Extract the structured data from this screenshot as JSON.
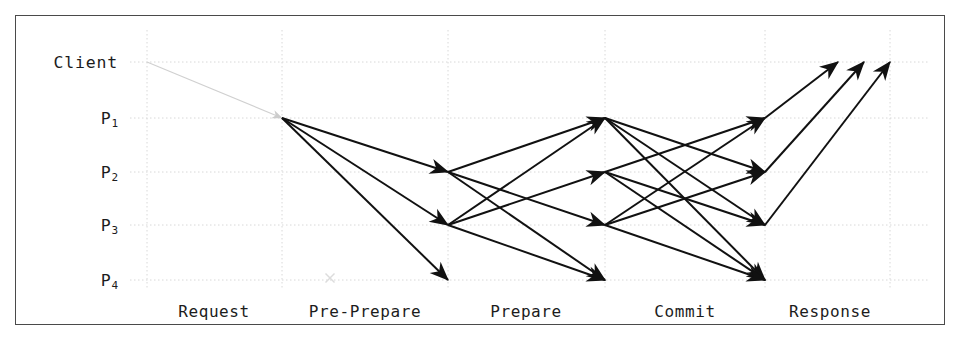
{
  "figure": {
    "kind": "sequence-diagram",
    "protocol": "PBFT consensus message flow",
    "background": "#ffffff",
    "border_color": "#4a4a4a",
    "grid_color": "#d8d8d8",
    "arrow_color": "#111111",
    "faint_arrow_color": "#d0d0d0",
    "fault_marker_color": "#dcdcdc"
  },
  "participants": [
    {
      "id": "client",
      "label": "Client",
      "sub": "",
      "y": 62,
      "faulty": false
    },
    {
      "id": "p1",
      "label": "P",
      "sub": "1",
      "y": 118,
      "faulty": false
    },
    {
      "id": "p2",
      "label": "P",
      "sub": "2",
      "y": 172,
      "faulty": false
    },
    {
      "id": "p3",
      "label": "P",
      "sub": "3",
      "y": 225,
      "faulty": false
    },
    {
      "id": "p4",
      "label": "P",
      "sub": "4",
      "y": 280,
      "faulty": true
    }
  ],
  "phases": [
    {
      "id": "request",
      "label": "Request",
      "x_center": 214,
      "x_start": 147,
      "x_end": 282
    },
    {
      "id": "pre-prepare",
      "label": "Pre-Prepare",
      "x_center": 365,
      "x_start": 282,
      "x_end": 448
    },
    {
      "id": "prepare",
      "label": "Prepare",
      "x_center": 526,
      "x_start": 448,
      "x_end": 605
    },
    {
      "id": "commit",
      "label": "Commit",
      "x_center": 685,
      "x_start": 605,
      "x_end": 765
    },
    {
      "id": "response",
      "label": "Response",
      "x_center": 830,
      "x_start": 765,
      "x_end": 890
    }
  ],
  "grid": {
    "vertical_x": [
      147,
      282,
      448,
      605,
      765,
      890
    ],
    "horizontal_y": [
      62,
      118,
      172,
      225,
      280
    ],
    "x_min": 40,
    "x_max": 930
  },
  "label_column_x": 118,
  "phase_label_y": 302,
  "fault_marker": {
    "x": 330,
    "y": 278,
    "size": 9,
    "on": "p4"
  },
  "messages": [
    {
      "phase": "request",
      "from": "client",
      "to": "p1",
      "x1": 147,
      "y1": 62,
      "x2": 282,
      "y2": 118,
      "faint": true
    },
    {
      "phase": "pre-prepare",
      "from": "p1",
      "to": "p2",
      "x1": 282,
      "y1": 118,
      "x2": 448,
      "y2": 172,
      "faint": false
    },
    {
      "phase": "pre-prepare",
      "from": "p1",
      "to": "p3",
      "x1": 282,
      "y1": 118,
      "x2": 448,
      "y2": 225,
      "faint": false
    },
    {
      "phase": "pre-prepare",
      "from": "p1",
      "to": "p4",
      "x1": 282,
      "y1": 118,
      "x2": 448,
      "y2": 280,
      "faint": false
    },
    {
      "phase": "prepare",
      "from": "p2",
      "to": "p1",
      "x1": 448,
      "y1": 172,
      "x2": 605,
      "y2": 118,
      "faint": false
    },
    {
      "phase": "prepare",
      "from": "p2",
      "to": "p3",
      "x1": 448,
      "y1": 172,
      "x2": 605,
      "y2": 225,
      "faint": false
    },
    {
      "phase": "prepare",
      "from": "p2",
      "to": "p4",
      "x1": 448,
      "y1": 172,
      "x2": 605,
      "y2": 280,
      "faint": false
    },
    {
      "phase": "prepare",
      "from": "p3",
      "to": "p1",
      "x1": 448,
      "y1": 225,
      "x2": 605,
      "y2": 118,
      "faint": false
    },
    {
      "phase": "prepare",
      "from": "p3",
      "to": "p2",
      "x1": 448,
      "y1": 225,
      "x2": 605,
      "y2": 172,
      "faint": false
    },
    {
      "phase": "prepare",
      "from": "p3",
      "to": "p4",
      "x1": 448,
      "y1": 225,
      "x2": 605,
      "y2": 280,
      "faint": false
    },
    {
      "phase": "commit",
      "from": "p1",
      "to": "p2",
      "x1": 605,
      "y1": 118,
      "x2": 765,
      "y2": 172,
      "faint": false
    },
    {
      "phase": "commit",
      "from": "p1",
      "to": "p3",
      "x1": 605,
      "y1": 118,
      "x2": 765,
      "y2": 225,
      "faint": false
    },
    {
      "phase": "commit",
      "from": "p1",
      "to": "p4",
      "x1": 605,
      "y1": 118,
      "x2": 765,
      "y2": 280,
      "faint": false
    },
    {
      "phase": "commit",
      "from": "p2",
      "to": "p1",
      "x1": 605,
      "y1": 172,
      "x2": 765,
      "y2": 118,
      "faint": false
    },
    {
      "phase": "commit",
      "from": "p2",
      "to": "p3",
      "x1": 605,
      "y1": 172,
      "x2": 765,
      "y2": 225,
      "faint": false
    },
    {
      "phase": "commit",
      "from": "p2",
      "to": "p4",
      "x1": 605,
      "y1": 172,
      "x2": 765,
      "y2": 280,
      "faint": false
    },
    {
      "phase": "commit",
      "from": "p3",
      "to": "p1",
      "x1": 605,
      "y1": 225,
      "x2": 765,
      "y2": 118,
      "faint": false
    },
    {
      "phase": "commit",
      "from": "p3",
      "to": "p2",
      "x1": 605,
      "y1": 225,
      "x2": 765,
      "y2": 172,
      "faint": false
    },
    {
      "phase": "commit",
      "from": "p3",
      "to": "p4",
      "x1": 605,
      "y1": 225,
      "x2": 765,
      "y2": 280,
      "faint": false
    },
    {
      "phase": "response",
      "from": "p1",
      "to": "client",
      "x1": 765,
      "y1": 118,
      "x2": 838,
      "y2": 62,
      "faint": false
    },
    {
      "phase": "response",
      "from": "p2",
      "to": "client",
      "x1": 765,
      "y1": 172,
      "x2": 864,
      "y2": 62,
      "faint": false
    },
    {
      "phase": "response",
      "from": "p3",
      "to": "client",
      "x1": 765,
      "y1": 225,
      "x2": 890,
      "y2": 62,
      "faint": false
    }
  ]
}
